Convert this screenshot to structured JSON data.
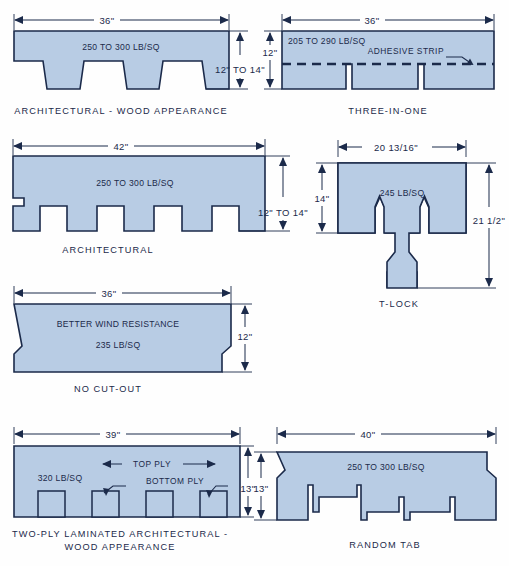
{
  "diagram": {
    "colors": {
      "shingle_fill": "#b8cce4",
      "outline": "#1b2a4a",
      "background": "#fefefe"
    }
  },
  "figures": [
    {
      "id": "architectural-wood-appearance",
      "caption": "ARCHITECTURAL - WOOD APPEARANCE",
      "width_dim": "36\"",
      "height_dim": "12\" TO 14\"",
      "weight_label": "250 TO 300 LB/SQ"
    },
    {
      "id": "three-in-one",
      "caption": "THREE-IN-ONE",
      "width_dim": "36\"",
      "height_dim": "12\"",
      "weight_label": "205 TO 290 LB/SQ",
      "annotation": "ADHESIVE STRIP"
    },
    {
      "id": "architectural",
      "caption": "ARCHITECTURAL",
      "width_dim": "42\"",
      "height_dim": "12\" TO 14\"",
      "weight_label": "250 TO 300 LB/SQ"
    },
    {
      "id": "t-lock",
      "caption": "T-LOCK",
      "width_dim": "20 13/16\"",
      "height_dim": "14\"",
      "overall_height_dim": "21 1/2\"",
      "weight_label": "245 LB/SQ"
    },
    {
      "id": "no-cut-out",
      "caption": "NO  CUT-OUT",
      "width_dim": "36\"",
      "height_dim": "12\"",
      "feature_label": "BETTER WIND RESISTANCE",
      "weight_label": "235 LB/SQ"
    },
    {
      "id": "two-ply-laminated",
      "caption_line1": "TWO-PLY LAMINATED ARCHITECTURAL -",
      "caption_line2": "WOOD APPEARANCE",
      "width_dim": "39\"",
      "height_dim": "13\"",
      "weight_label": "320 LB/SQ",
      "annotation_top": "TOP PLY",
      "annotation_bottom": "BOTTOM PLY"
    },
    {
      "id": "random-tab",
      "caption": "RANDOM  TAB",
      "width_dim": "40\"",
      "height_dim": "13\"",
      "weight_label": "250 TO 300 LB/SQ"
    }
  ]
}
